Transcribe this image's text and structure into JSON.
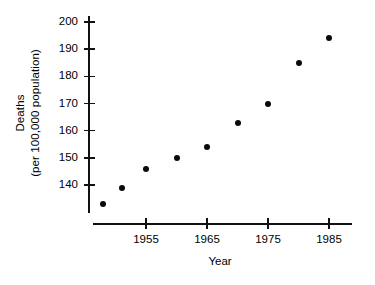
{
  "chart_data": {
    "type": "scatter",
    "title": "",
    "xlabel": "Year",
    "ylabel": "Deaths\n(per 100,000 population)",
    "ylabel_lines": [
      "Deaths",
      "(per 100,000 population)"
    ],
    "xlim": [
      1946,
      1989
    ],
    "ylim": [
      132,
      203
    ],
    "grid": false,
    "legend": null,
    "xticks": [
      1955,
      1965,
      1975,
      1985
    ],
    "xtick_labels": [
      "1955",
      "1965",
      "1975",
      "1985"
    ],
    "yticks": [
      140,
      150,
      160,
      170,
      180,
      190,
      200
    ],
    "ytick_labels": [
      "140",
      "150",
      "160",
      "170",
      "180",
      "190",
      "200"
    ],
    "x": [
      1948,
      1951,
      1955,
      1960,
      1965,
      1970,
      1975,
      1980,
      1985
    ],
    "y": [
      133,
      139,
      146,
      150,
      154,
      163,
      170,
      185,
      194
    ],
    "points": [
      {
        "x": 1948,
        "y": 133
      },
      {
        "x": 1951,
        "y": 139
      },
      {
        "x": 1955,
        "y": 146
      },
      {
        "x": 1960,
        "y": 150
      },
      {
        "x": 1965,
        "y": 154
      },
      {
        "x": 1970,
        "y": 163
      },
      {
        "x": 1975,
        "y": 170
      },
      {
        "x": 1980,
        "y": 185
      },
      {
        "x": 1985,
        "y": 194
      }
    ],
    "marker": "filled-circle",
    "marker_color": "#0a0a0a",
    "axis_color": "#111111",
    "background": "#ffffff"
  }
}
